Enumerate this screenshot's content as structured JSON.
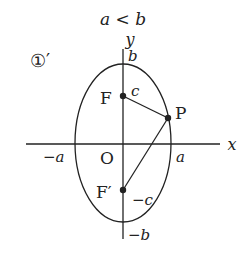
{
  "title": "a < b",
  "label_number": "①′",
  "axes": {
    "x": "x",
    "y": "y"
  },
  "ticks": {
    "b": "b",
    "neg_b": "−b",
    "a": "a",
    "neg_a": "−a",
    "c": "c",
    "neg_c": "−c"
  },
  "points": {
    "origin": "O",
    "focus": "F",
    "focus_prime": "F′",
    "point": "P"
  },
  "colors": {
    "stroke": "#222222",
    "background": "#ffffff"
  }
}
